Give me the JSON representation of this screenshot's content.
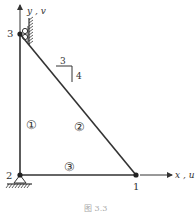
{
  "diagram": {
    "type": "truss",
    "nodes": [
      {
        "id": "1",
        "label": "1"
      },
      {
        "id": "2",
        "label": "2"
      },
      {
        "id": "3",
        "label": "3"
      }
    ],
    "elements": [
      {
        "id": "1",
        "label": "①",
        "from": "2",
        "to": "3"
      },
      {
        "id": "2",
        "label": "②",
        "from": "3",
        "to": "1"
      },
      {
        "id": "3",
        "label": "③",
        "from": "2",
        "to": "1"
      }
    ],
    "slope": {
      "run": "3",
      "rise": "4"
    },
    "axes": {
      "x_label": "x , u",
      "y_label": "y , v"
    },
    "supports": {
      "node_2": "pin",
      "node_3": "roller (wall)"
    },
    "caption": "图 3.3"
  },
  "colors": {
    "line": "#333333",
    "background": "#ffffff"
  }
}
